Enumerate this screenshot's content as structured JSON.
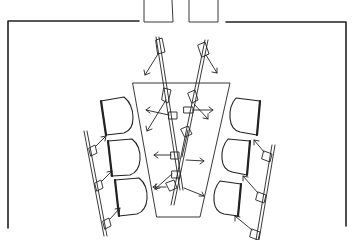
{
  "diagram": {
    "title": "",
    "elements": {
      "room": {
        "label": "room-walls"
      },
      "door": {
        "label": "double-door",
        "panels": 2
      },
      "table": {
        "label": "trapezoid-table"
      },
      "chairs_left": 3,
      "chairs_right": 3,
      "stands": [
        "left-stand",
        "right-stand",
        "center-left-stand",
        "center-right-stand"
      ]
    },
    "caption_cropped": "(cut off)"
  },
  "colors": {
    "line": "#222222",
    "background": "#ffffff"
  }
}
